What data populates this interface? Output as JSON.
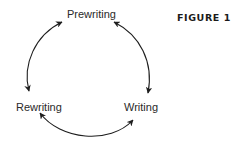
{
  "figure": {
    "label": "FIGURE 1",
    "stages": [
      {
        "name": "Prewriting"
      },
      {
        "name": "Writing"
      },
      {
        "name": "Rewriting"
      }
    ],
    "arrows": [
      {
        "from": "Prewriting",
        "to": "Writing",
        "bidirectional": true
      },
      {
        "from": "Writing",
        "to": "Rewriting",
        "bidirectional": true
      },
      {
        "from": "Rewriting",
        "to": "Prewriting",
        "bidirectional": true
      }
    ],
    "colors": {
      "stroke": "#1e1e1e",
      "text": "#2a2a2a",
      "background": "#ffffff"
    }
  }
}
